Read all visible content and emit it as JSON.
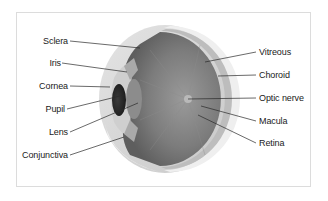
{
  "diagram": {
    "labels_left": [
      {
        "id": "sclera",
        "text": "Sclera"
      },
      {
        "id": "iris",
        "text": "Iris"
      },
      {
        "id": "cornea",
        "text": "Cornea"
      },
      {
        "id": "pupil",
        "text": "Pupil"
      },
      {
        "id": "lens",
        "text": "Lens"
      },
      {
        "id": "conjunctiva",
        "text": "Conjunctiva"
      }
    ],
    "labels_right": [
      {
        "id": "vitreous",
        "text": "Vitreous"
      },
      {
        "id": "choroid",
        "text": "Choroid"
      },
      {
        "id": "optic_nerve",
        "text": "Optic nerve"
      },
      {
        "id": "macula",
        "text": "Macula"
      },
      {
        "id": "retina",
        "text": "Retina"
      }
    ],
    "colors": {
      "background": "#ffffff",
      "border": "#dcdcdc",
      "label_text": "#1a1a1a",
      "leader_line": "#2a2a2a",
      "sclera": "#d9d9d9",
      "interior": "#7a7a7a",
      "pupil": "#2b2b2b"
    }
  }
}
